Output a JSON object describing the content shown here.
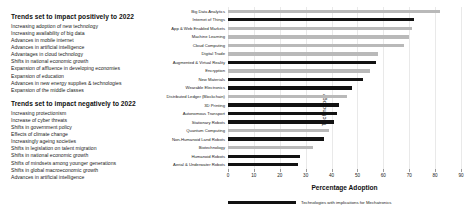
{
  "panels": {
    "positive": {
      "title": "Trends set to impact positively to 2022",
      "items": [
        "Increasing adoption of new technology",
        "Increasing availability of big data",
        "Advances in mobile internet",
        "Advances in artificial intelligence",
        "Advantages in cloud technology",
        "Shifts in national economic growth",
        "Expansion of affluence in developing economies",
        "Expansion of education",
        "Advances in new energy supplies & technologies",
        "Expansion of the middle classes"
      ]
    },
    "negative": {
      "title": "Trends set to impact negatively to 2022",
      "items": [
        "Increasing protectionism",
        "Increase of cyber threats",
        "Shifts in government policy",
        "Effects of climate change",
        "Increasingly ageing societies",
        "Shifts in legislation on talent migration",
        "Shifts in national economic growth",
        "Shifts of mindsets among younger generations",
        "Shifts in global macroeconomic growth",
        "Advances in artificial intelligence"
      ]
    }
  },
  "chart_data": {
    "type": "bar",
    "orientation": "horizontal",
    "title": "",
    "xlabel": "Percentage Adoption",
    "ylabel": "Technology",
    "xlim": [
      0,
      90
    ],
    "xticks": [
      0,
      10,
      20,
      30,
      40,
      50,
      60,
      70,
      80,
      90
    ],
    "grid": true,
    "legend": {
      "position": "bottom-left",
      "entries": [
        {
          "label": "Technologies with implications for Mechatronics",
          "color": "#121212"
        }
      ]
    },
    "colors": {
      "highlight": "#121212",
      "other": "#b9b9b9"
    },
    "categories": [
      "Big Data Analytics",
      "Internet of Things",
      "App & Web Enabled Markets",
      "Machine Learning",
      "Cloud Computing",
      "Digital Trade",
      "Augmented & Virtual Reality",
      "Encryption",
      "New Materials",
      "Wearable Electronics",
      "Distributed Ledger (Blockchain)",
      "3D Printing",
      "Autonomous Transport",
      "Stationary Robots",
      "Quantum Computing",
      "Non-Humanoid Land Robots",
      "Biotechnology",
      "Humanoid Robots",
      "Aerial & Underwater Robots"
    ],
    "values": [
      82,
      72,
      71,
      70,
      68,
      58,
      57,
      55,
      52,
      48,
      46,
      43,
      42,
      41,
      39,
      37,
      33,
      28,
      27
    ],
    "highlighted": [
      false,
      true,
      false,
      false,
      false,
      false,
      true,
      false,
      true,
      true,
      false,
      true,
      true,
      true,
      false,
      true,
      false,
      true,
      true
    ]
  }
}
